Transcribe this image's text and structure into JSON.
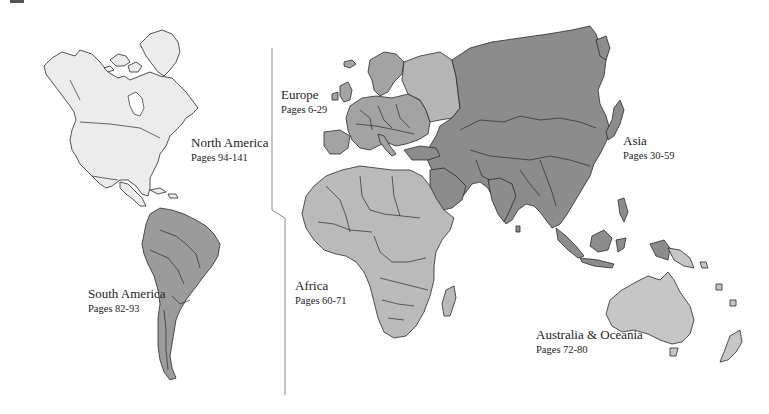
{
  "map": {
    "title": "World continents page index",
    "colors": {
      "north_america": "#ececec",
      "south_america": "#9b9b9b",
      "europe": "#a3a3a3",
      "european_russia": "#b5b5b5",
      "asia": "#8c8c8c",
      "africa": "#bababa",
      "australia_oceania": "#c6c6c6",
      "border": "#2a2a2a",
      "divider": "#888888"
    },
    "regions": [
      {
        "id": "north_america",
        "name": "North America",
        "pages": "Pages 94-141"
      },
      {
        "id": "south_america",
        "name": "South America",
        "pages": "Pages 82-93"
      },
      {
        "id": "europe",
        "name": "Europe",
        "pages": "Pages 6-29"
      },
      {
        "id": "asia",
        "name": "Asia",
        "pages": "Pages 30-59"
      },
      {
        "id": "africa",
        "name": "Africa",
        "pages": "Pages 60-71"
      },
      {
        "id": "australia_oceania",
        "name": "Australia & Oceania",
        "pages": "Pages 72-80"
      }
    ]
  }
}
